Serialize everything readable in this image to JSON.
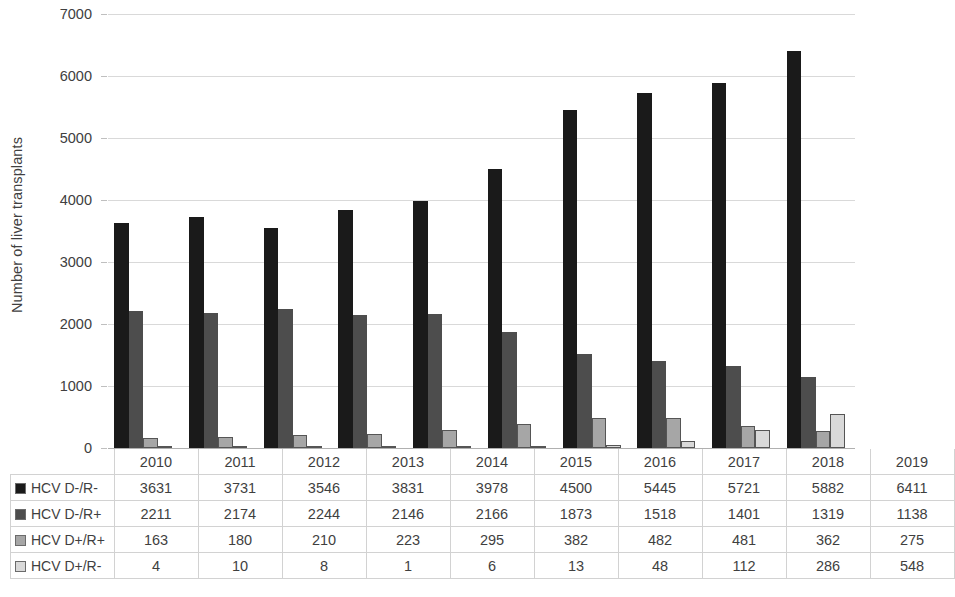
{
  "chart_data": {
    "type": "bar",
    "title": "",
    "xlabel": "",
    "ylabel": "Number of liver transplants",
    "ylim": [
      0,
      7000
    ],
    "ytick_step": 1000,
    "yticks": [
      "0",
      "1000",
      "2000",
      "3000",
      "4000",
      "5000",
      "6000",
      "7000"
    ],
    "grid": true,
    "legend_position": "data-table",
    "categories": [
      "2010",
      "2011",
      "2012",
      "2013",
      "2014",
      "2015",
      "2016",
      "2017",
      "2018",
      "2019"
    ],
    "series": [
      {
        "name": "HCV D-/R-",
        "color": "#1a1a1a",
        "values": [
          3631,
          3731,
          3546,
          3831,
          3978,
          4500,
          5445,
          5721,
          5882,
          6411
        ]
      },
      {
        "name": "HCV D-/R+",
        "color": "#4d4d4d",
        "values": [
          2211,
          2174,
          2244,
          2146,
          2166,
          1873,
          1518,
          1401,
          1319,
          1138
        ]
      },
      {
        "name": "HCV D+/R+",
        "color": "#a6a6a6",
        "values": [
          163,
          180,
          210,
          223,
          295,
          382,
          482,
          481,
          362,
          275
        ]
      },
      {
        "name": "HCV D+/R-",
        "color": "#d9d9d9",
        "values": [
          4,
          10,
          8,
          1,
          6,
          13,
          48,
          112,
          286,
          548
        ]
      }
    ]
  },
  "table": {
    "corner_label": "",
    "column_headers": [
      "2010",
      "2011",
      "2012",
      "2013",
      "2014",
      "2015",
      "2016",
      "2017",
      "2018",
      "2019"
    ],
    "rows": [
      {
        "label": "HCV D-/R-",
        "swatch_color": "#1a1a1a",
        "cells": [
          "3631",
          "3731",
          "3546",
          "3831",
          "3978",
          "4500",
          "5445",
          "5721",
          "5882",
          "6411"
        ]
      },
      {
        "label": "HCV D-/R+",
        "swatch_color": "#4d4d4d",
        "cells": [
          "2211",
          "2174",
          "2244",
          "2146",
          "2166",
          "1873",
          "1518",
          "1401",
          "1319",
          "1138"
        ]
      },
      {
        "label": "HCV D+/R+",
        "swatch_color": "#a6a6a6",
        "cells": [
          "163",
          "180",
          "210",
          "223",
          "295",
          "382",
          "482",
          "481",
          "362",
          "275"
        ]
      },
      {
        "label": "HCV D+/R-",
        "swatch_color": "#d9d9d9",
        "cells": [
          "4",
          "10",
          "8",
          "1",
          "6",
          "13",
          "48",
          "112",
          "286",
          "548"
        ]
      }
    ]
  },
  "colors": {
    "gridline": "#d9d9d9",
    "axis": "#b0b0b0",
    "text": "#404040",
    "table_border": "#d2d2d2",
    "background": "#ffffff"
  }
}
